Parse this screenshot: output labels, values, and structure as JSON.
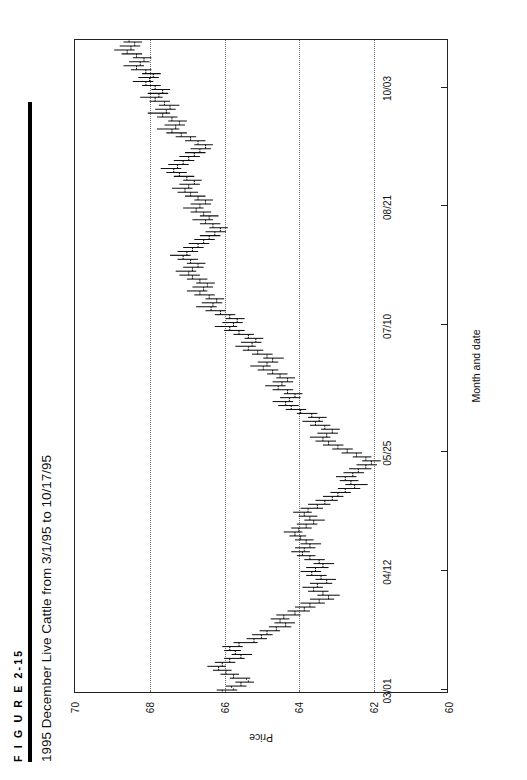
{
  "figure": {
    "number": "F I G U R E   2-15",
    "title": "1995 December Live Cattle from 3/1/95 to 10/17/95"
  },
  "chart_data": {
    "type": "bar",
    "subtype": "ohlc-bar-chart",
    "title": "1995 December Live Cattle from 3/1/95 to 10/17/95",
    "xlabel": "Month and date",
    "ylabel": "Price",
    "ylim": [
      60,
      70
    ],
    "yticks": [
      70,
      68,
      66,
      64,
      62,
      60
    ],
    "ytick_labels": [
      "70",
      "68",
      "66",
      "64",
      "62",
      "60"
    ],
    "xtick_labels": [
      "03/01",
      "04/12",
      "05/25",
      "07/10",
      "08/21",
      "10/03"
    ],
    "xtick_indices": [
      0,
      30,
      60,
      92,
      122,
      152
    ],
    "grid": "vertical dotted gridlines at 68, 66, 64, 62",
    "legend": "none",
    "orientation": "figure printed rotated 90 degrees counter-clockwise",
    "n_bars": 165,
    "series": [
      {
        "name": "1995 December Live Cattle",
        "fields": [
          "open",
          "high",
          "low",
          "close"
        ],
        "bars": [
          [
            66.05,
            66.2,
            65.65,
            65.75
          ],
          [
            65.8,
            65.95,
            65.4,
            65.55
          ],
          [
            65.55,
            65.7,
            65.2,
            65.35
          ],
          [
            65.4,
            65.85,
            65.3,
            65.75
          ],
          [
            65.75,
            66.1,
            65.6,
            65.95
          ],
          [
            65.95,
            66.3,
            65.8,
            66.15
          ],
          [
            66.15,
            66.45,
            65.95,
            66.05
          ],
          [
            66.05,
            66.25,
            65.7,
            65.85
          ],
          [
            65.85,
            66.0,
            65.45,
            65.55
          ],
          [
            65.55,
            65.8,
            65.25,
            65.7
          ],
          [
            65.7,
            66.0,
            65.55,
            65.85
          ],
          [
            65.85,
            66.05,
            65.5,
            65.6
          ],
          [
            65.6,
            65.75,
            65.1,
            65.2
          ],
          [
            65.2,
            65.4,
            64.85,
            65.0
          ],
          [
            65.0,
            65.25,
            64.7,
            64.85
          ],
          [
            64.85,
            65.05,
            64.5,
            64.6
          ],
          [
            64.6,
            64.8,
            64.2,
            64.35
          ],
          [
            64.35,
            64.65,
            64.1,
            64.5
          ],
          [
            64.5,
            64.75,
            64.25,
            64.4
          ],
          [
            64.4,
            64.6,
            63.95,
            64.1
          ],
          [
            64.1,
            64.3,
            63.7,
            63.85
          ],
          [
            63.85,
            64.1,
            63.55,
            63.7
          ],
          [
            63.7,
            63.95,
            63.3,
            63.45
          ],
          [
            63.45,
            63.7,
            63.05,
            63.2
          ],
          [
            63.2,
            63.5,
            62.9,
            63.35
          ],
          [
            63.35,
            63.75,
            63.2,
            63.6
          ],
          [
            63.6,
            63.9,
            63.35,
            63.5
          ],
          [
            63.5,
            63.7,
            63.1,
            63.25
          ],
          [
            63.25,
            63.55,
            63.0,
            63.4
          ],
          [
            63.4,
            63.8,
            63.25,
            63.65
          ],
          [
            63.65,
            63.95,
            63.4,
            63.55
          ],
          [
            63.55,
            63.8,
            63.2,
            63.35
          ],
          [
            63.35,
            63.6,
            63.05,
            63.45
          ],
          [
            63.45,
            63.85,
            63.3,
            63.7
          ],
          [
            63.7,
            64.05,
            63.55,
            63.9
          ],
          [
            63.9,
            64.2,
            63.7,
            63.85
          ],
          [
            63.85,
            64.1,
            63.55,
            63.7
          ],
          [
            63.7,
            63.95,
            63.4,
            63.8
          ],
          [
            63.8,
            64.1,
            63.6,
            63.95
          ],
          [
            63.95,
            64.25,
            63.8,
            64.1
          ],
          [
            64.1,
            64.4,
            63.9,
            64.0
          ],
          [
            64.0,
            64.2,
            63.65,
            63.8
          ],
          [
            63.8,
            64.05,
            63.5,
            63.6
          ],
          [
            63.6,
            63.85,
            63.3,
            63.7
          ],
          [
            63.7,
            64.0,
            63.5,
            63.85
          ],
          [
            63.85,
            64.15,
            63.65,
            63.75
          ],
          [
            63.75,
            63.95,
            63.35,
            63.5
          ],
          [
            63.5,
            63.75,
            63.15,
            63.3
          ],
          [
            63.3,
            63.55,
            62.95,
            63.1
          ],
          [
            63.1,
            63.35,
            62.8,
            62.95
          ],
          [
            62.95,
            63.15,
            62.6,
            62.75
          ],
          [
            62.75,
            62.95,
            62.35,
            62.5
          ],
          [
            62.5,
            62.75,
            62.15,
            62.6
          ],
          [
            62.6,
            62.9,
            62.4,
            62.75
          ],
          [
            62.75,
            63.0,
            62.45,
            62.55
          ],
          [
            62.55,
            62.8,
            62.25,
            62.4
          ],
          [
            62.4,
            62.65,
            62.05,
            62.2
          ],
          [
            62.2,
            62.45,
            61.9,
            62.05
          ],
          [
            62.05,
            62.3,
            61.8,
            62.2
          ],
          [
            62.2,
            62.55,
            62.05,
            62.45
          ],
          [
            62.45,
            62.85,
            62.3,
            62.7
          ],
          [
            62.7,
            63.1,
            62.55,
            62.95
          ],
          [
            62.95,
            63.35,
            62.8,
            63.2
          ],
          [
            63.2,
            63.55,
            63.0,
            63.35
          ],
          [
            63.35,
            63.7,
            63.15,
            63.25
          ],
          [
            63.25,
            63.5,
            62.95,
            63.1
          ],
          [
            63.1,
            63.4,
            62.9,
            63.3
          ],
          [
            63.3,
            63.7,
            63.15,
            63.55
          ],
          [
            63.55,
            63.9,
            63.35,
            63.45
          ],
          [
            63.45,
            63.75,
            63.25,
            63.65
          ],
          [
            63.65,
            64.05,
            63.5,
            63.95
          ],
          [
            63.95,
            64.35,
            63.8,
            64.2
          ],
          [
            64.2,
            64.55,
            64.0,
            64.35
          ],
          [
            64.35,
            64.7,
            64.15,
            64.25
          ],
          [
            64.25,
            64.5,
            63.95,
            64.1
          ],
          [
            64.1,
            64.4,
            63.9,
            64.3
          ],
          [
            64.3,
            64.7,
            64.15,
            64.55
          ],
          [
            64.55,
            64.9,
            64.35,
            64.45
          ],
          [
            64.45,
            64.7,
            64.15,
            64.3
          ],
          [
            64.3,
            64.6,
            64.1,
            64.5
          ],
          [
            64.5,
            64.85,
            64.3,
            64.7
          ],
          [
            64.7,
            65.1,
            64.55,
            64.95
          ],
          [
            64.95,
            65.3,
            64.75,
            64.85
          ],
          [
            64.85,
            65.1,
            64.55,
            64.7
          ],
          [
            64.7,
            64.95,
            64.4,
            64.85
          ],
          [
            64.85,
            65.25,
            64.7,
            65.1
          ],
          [
            65.1,
            65.5,
            64.95,
            65.35
          ],
          [
            65.35,
            65.7,
            65.15,
            65.25
          ],
          [
            65.25,
            65.55,
            65.0,
            65.15
          ],
          [
            65.15,
            65.45,
            64.95,
            65.35
          ],
          [
            65.35,
            65.75,
            65.2,
            65.6
          ],
          [
            65.6,
            66.0,
            65.45,
            65.85
          ],
          [
            65.85,
            66.25,
            65.65,
            65.75
          ],
          [
            65.75,
            66.05,
            65.5,
            65.65
          ],
          [
            65.65,
            65.95,
            65.45,
            65.85
          ],
          [
            65.85,
            66.25,
            65.7,
            66.1
          ],
          [
            66.1,
            66.5,
            65.95,
            66.35
          ],
          [
            66.35,
            66.75,
            66.2,
            66.3
          ],
          [
            66.3,
            66.6,
            66.05,
            66.2
          ],
          [
            66.2,
            66.5,
            66.0,
            66.4
          ],
          [
            66.4,
            66.8,
            66.25,
            66.65
          ],
          [
            66.65,
            67.0,
            66.45,
            66.55
          ],
          [
            66.55,
            66.85,
            66.3,
            66.45
          ],
          [
            66.45,
            66.75,
            66.25,
            66.65
          ],
          [
            66.65,
            67.0,
            66.45,
            66.85
          ],
          [
            66.85,
            67.2,
            66.65,
            66.95
          ],
          [
            66.95,
            67.3,
            66.75,
            66.85
          ],
          [
            66.85,
            67.1,
            66.55,
            66.7
          ],
          [
            66.7,
            67.0,
            66.5,
            66.9
          ],
          [
            66.9,
            67.25,
            66.7,
            67.1
          ],
          [
            67.1,
            67.45,
            66.9,
            67.0
          ],
          [
            67.0,
            67.25,
            66.7,
            66.85
          ],
          [
            66.85,
            67.1,
            66.55,
            66.7
          ],
          [
            66.7,
            66.95,
            66.4,
            66.55
          ],
          [
            66.55,
            66.8,
            66.25,
            66.4
          ],
          [
            66.4,
            66.65,
            66.1,
            66.25
          ],
          [
            66.25,
            66.5,
            65.95,
            66.1
          ],
          [
            66.1,
            66.4,
            65.9,
            66.3
          ],
          [
            66.3,
            66.65,
            66.1,
            66.5
          ],
          [
            66.5,
            66.85,
            66.3,
            66.4
          ],
          [
            66.4,
            66.65,
            66.15,
            66.55
          ],
          [
            66.55,
            66.9,
            66.35,
            66.75
          ],
          [
            66.75,
            67.1,
            66.55,
            66.65
          ],
          [
            66.65,
            66.9,
            66.35,
            66.5
          ],
          [
            66.5,
            66.8,
            66.3,
            66.7
          ],
          [
            66.7,
            67.05,
            66.5,
            66.9
          ],
          [
            66.9,
            67.25,
            66.7,
            67.05
          ],
          [
            67.05,
            67.4,
            66.85,
            66.95
          ],
          [
            66.95,
            67.2,
            66.65,
            66.8
          ],
          [
            66.8,
            67.1,
            66.6,
            67.0
          ],
          [
            67.0,
            67.35,
            66.8,
            67.2
          ],
          [
            67.2,
            67.55,
            67.0,
            67.35
          ],
          [
            67.35,
            67.7,
            67.15,
            67.25
          ],
          [
            67.25,
            67.5,
            66.95,
            67.1
          ],
          [
            67.1,
            67.35,
            66.8,
            66.95
          ],
          [
            66.95,
            67.2,
            66.65,
            66.8
          ],
          [
            66.8,
            67.05,
            66.5,
            66.65
          ],
          [
            66.65,
            66.9,
            66.35,
            66.5
          ],
          [
            66.5,
            66.8,
            66.3,
            66.7
          ],
          [
            66.7,
            67.05,
            66.5,
            66.9
          ],
          [
            66.9,
            67.3,
            66.75,
            67.15
          ],
          [
            67.15,
            67.55,
            67.0,
            67.4
          ],
          [
            67.4,
            67.8,
            67.2,
            67.3
          ],
          [
            67.3,
            67.6,
            67.05,
            67.2
          ],
          [
            67.2,
            67.5,
            67.0,
            67.4
          ],
          [
            67.4,
            67.8,
            67.25,
            67.65
          ],
          [
            67.65,
            68.05,
            67.45,
            67.55
          ],
          [
            67.55,
            67.85,
            67.3,
            67.45
          ],
          [
            67.45,
            67.75,
            67.2,
            67.6
          ],
          [
            67.6,
            68.0,
            67.45,
            67.85
          ],
          [
            67.85,
            68.25,
            67.65,
            67.75
          ],
          [
            67.75,
            68.05,
            67.5,
            67.65
          ],
          [
            67.65,
            67.95,
            67.45,
            67.85
          ],
          [
            67.85,
            68.2,
            67.7,
            68.1
          ],
          [
            68.1,
            68.45,
            67.9,
            68.0
          ],
          [
            68.0,
            68.3,
            67.75,
            67.9
          ],
          [
            67.9,
            68.2,
            67.7,
            68.1
          ],
          [
            68.1,
            68.5,
            67.95,
            68.35
          ],
          [
            68.35,
            68.7,
            68.15,
            68.25
          ],
          [
            68.25,
            68.55,
            68.0,
            68.15
          ],
          [
            68.15,
            68.45,
            67.95,
            68.35
          ],
          [
            68.35,
            68.75,
            68.2,
            68.6
          ],
          [
            68.6,
            68.95,
            68.4,
            68.5
          ],
          [
            68.5,
            68.8,
            68.25,
            68.4
          ],
          [
            68.4,
            68.7,
            68.2,
            68.55
          ]
        ]
      }
    ]
  }
}
